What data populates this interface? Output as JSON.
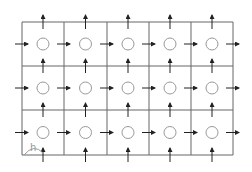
{
  "diagram": {
    "type": "staggered-grid-cells",
    "columns": 5,
    "rows": 3,
    "grid": {
      "x_lines": [
        22,
        64,
        107,
        149,
        191,
        233
      ],
      "y_lines": [
        22,
        66,
        110,
        155
      ],
      "line_color": "#555555"
    },
    "cell_centers": {
      "circle_radius": 6,
      "circle_color": "#999999"
    },
    "arrows": {
      "horizontal": "right-pointing arrows on each vertical face at cell-center height",
      "vertical": "upward arrows on each horizontal face at cell-center x",
      "color": "#222222"
    },
    "annotation": {
      "label": "h",
      "position": "bottom-left cell, arc spanning half a cell width"
    }
  }
}
